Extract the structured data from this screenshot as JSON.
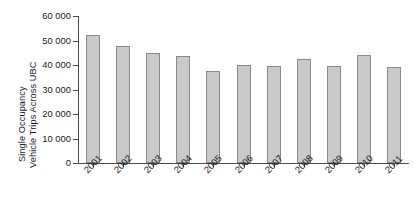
{
  "chart_data": {
    "type": "bar",
    "title": "",
    "subtitle": "",
    "xlabel": "",
    "ylabel": "Single Occupancy Vehicle Trips Across UBC",
    "ylabel_lines": [
      "Single Occupancy",
      "Vehicle Trips Across UBC"
    ],
    "categories": [
      "2001",
      "2002",
      "2003",
      "2004",
      "2005",
      "2006",
      "2007",
      "2008",
      "2009",
      "2010",
      "2011"
    ],
    "values": [
      52200,
      47800,
      45000,
      43700,
      37400,
      40200,
      39600,
      42500,
      39500,
      44200,
      39200
    ],
    "ylim": [
      0,
      60000
    ],
    "y_ticks": [
      0,
      10000,
      20000,
      30000,
      40000,
      50000,
      60000
    ],
    "y_tick_labels": [
      "0",
      "10 000",
      "20 000",
      "30 000",
      "40 000",
      "50 000",
      "60 000"
    ],
    "x_tick_labels": [
      "2001",
      "2002",
      "2003",
      "2004",
      "2005",
      "2006",
      "2007",
      "2008",
      "2009",
      "2010",
      "2011"
    ],
    "grid": false,
    "legend": null,
    "legend_position": "none",
    "series": [
      {
        "name": "Single Occupancy Vehicle Trips Across UBC",
        "values": [
          52200,
          47800,
          45000,
          43700,
          37400,
          40200,
          39600,
          42500,
          39500,
          44200,
          39200
        ]
      }
    ],
    "colors": {
      "bar_fill": "#c9c9c9",
      "bar_border": "#8a8a8a",
      "axis": "#4d4d4d",
      "text": "#1a1a1a",
      "background": "#ffffff"
    }
  }
}
